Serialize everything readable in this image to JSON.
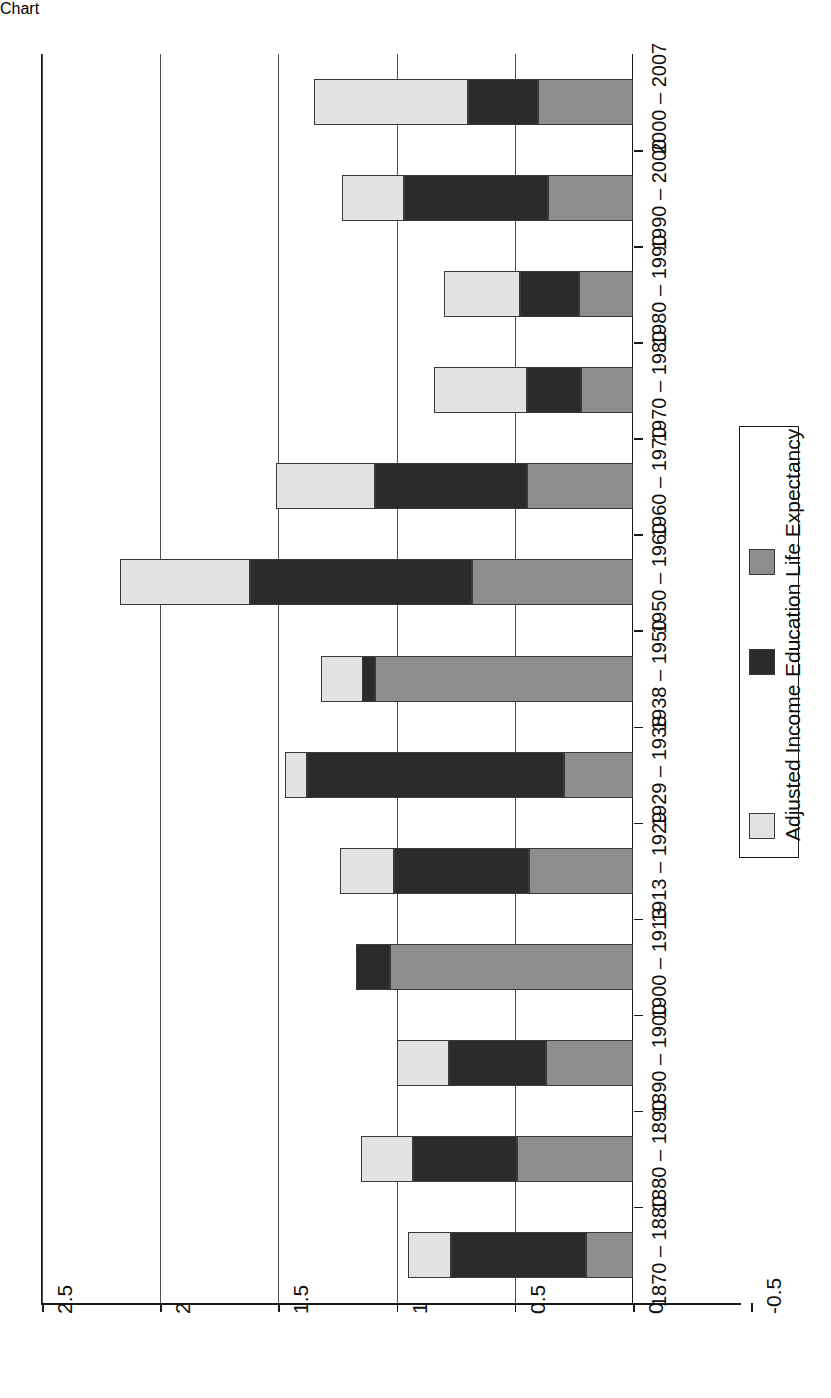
{
  "chart_data": {
    "type": "bar",
    "orientation": "horizontal-stacked",
    "title": "",
    "xlabel": "",
    "ylabel": "",
    "xlim": [
      -0.5,
      2.5
    ],
    "grid": true,
    "legend_position": "right",
    "tick_labels": [
      "2.5",
      "2",
      "1.5",
      "1",
      "0.5",
      "0",
      "-0.5"
    ],
    "tick_values": [
      2.5,
      2,
      1.5,
      1,
      0.5,
      0,
      -0.5
    ],
    "categories": [
      "1870 – 1880",
      "1880 – 1890",
      "1890 – 1900",
      "1900 – 1913",
      "1913 – 1929",
      "1929 – 1938",
      "1938 – 1950",
      "1950 – 1960",
      "1960 – 1970",
      "1970 – 1980",
      "1980 – 1990",
      "1990 – 2000",
      "2000 – 2007"
    ],
    "series": [
      {
        "name": "Life Expectancy",
        "color": "#8e8e8e",
        "values": [
          0.2,
          0.49,
          0.37,
          1.03,
          0.44,
          0.29,
          1.09,
          0.68,
          0.45,
          0.22,
          0.23,
          0.36,
          0.4
        ]
      },
      {
        "name": "Education",
        "color": "#2b2b2b",
        "values": [
          0.57,
          0.44,
          0.41,
          0.14,
          0.57,
          1.09,
          0.23,
          0.94,
          0.64,
          0.23,
          0.25,
          0.61,
          0.3
        ]
      },
      {
        "name": "Adjusted Income",
        "color": "#e2e2e2",
        "values": [
          0.18,
          0.22,
          0.22,
          0.0,
          0.23,
          0.09,
          -0.18,
          0.55,
          0.42,
          0.39,
          0.32,
          0.26,
          0.65
        ]
      }
    ],
    "totals": [
      0.95,
      1.15,
      1.0,
      1.17,
      1.24,
      1.47,
      1.14,
      2.17,
      1.51,
      0.84,
      0.8,
      1.23,
      1.35
    ]
  },
  "legend": {
    "items": [
      {
        "label": "Adjusted Income",
        "swatch": "income-swatch"
      },
      {
        "label": "Education",
        "swatch": "education-swatch"
      },
      {
        "label": "Life Expectancy",
        "swatch": "lifeexp-swatch"
      }
    ]
  }
}
